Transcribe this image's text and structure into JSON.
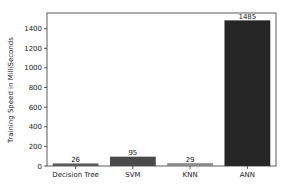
{
  "chart_data": {
    "type": "bar",
    "title": "",
    "xlabel": "",
    "ylabel": "Training Speed in MilliSeconds",
    "categories": [
      "Decision Tree",
      "SVM",
      "KNN",
      "ANN"
    ],
    "values": [
      26,
      95,
      29,
      1485
    ],
    "data_labels": [
      "26",
      "95",
      "29",
      "1485"
    ],
    "colors": [
      "#595959",
      "#4a4a4a",
      "#8a8a8a",
      "#262626"
    ],
    "ylim": [
      0,
      1560
    ],
    "yticks": [
      0,
      200,
      400,
      600,
      800,
      1000,
      1200,
      1400
    ],
    "ytick_labels": [
      "0",
      "200",
      "400",
      "600",
      "800",
      "1000",
      "1200",
      "1400"
    ],
    "grid": false,
    "legend": "none"
  }
}
